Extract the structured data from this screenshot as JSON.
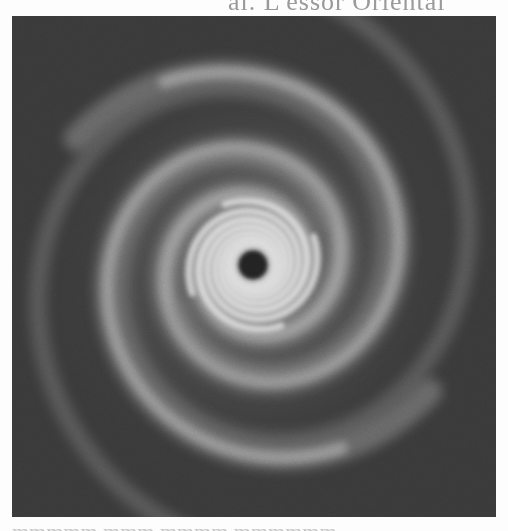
{
  "page": {
    "header_text_cropped": "al. L'essor Oriental",
    "footer_text_cropped": "mmmmm mmm mmmm mmmmmm"
  },
  "figure": {
    "colors": {
      "background": "#3a3a3a",
      "arm_outer": "#8a8a8a",
      "arm_mid": "#b4b4b4",
      "arm_inner": "#e6e6e6",
      "core_hole": "#1e1e1e"
    },
    "center": {
      "x": 241,
      "y": 249
    },
    "hole_radius": 15
  }
}
